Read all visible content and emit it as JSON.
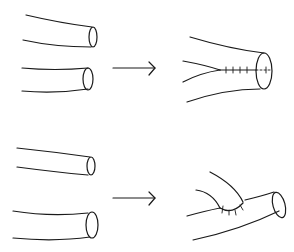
{
  "diagram": {
    "colors": {
      "line": "#1a1a1a",
      "background": "#ffffff"
    },
    "rows": [
      {
        "id": "end-to-end",
        "before": [
          "tube-upper",
          "tube-lower"
        ],
        "arrow": "right-arrow",
        "after": "tubes-joined-end-to-end-with-sutures"
      },
      {
        "id": "end-to-side",
        "before": [
          "tube-upper",
          "tube-lower"
        ],
        "arrow": "right-arrow",
        "after": "tube-joined-end-to-side-with-sutures"
      }
    ]
  }
}
